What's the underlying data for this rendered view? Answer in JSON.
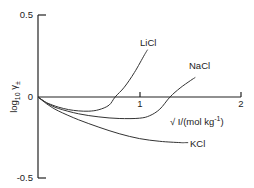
{
  "chart_data": {
    "type": "line",
    "title": "",
    "xlabel": "√ I/(mol kg⁻¹)",
    "xlabel_parts": {
      "sqrt": "√",
      "base": " I/(mol kg",
      "sup": "-1",
      "close": ")"
    },
    "ylabel": "log10 γ±",
    "ylabel_parts": {
      "log": "log",
      "sub": "10",
      "gamma": " γ",
      "pm": "±"
    },
    "xlim": [
      0,
      2
    ],
    "ylim": [
      -0.5,
      0.5
    ],
    "x_ticks": [
      {
        "value": 1,
        "label": "1"
      },
      {
        "value": 2,
        "label": "2"
      }
    ],
    "y_ticks": [
      {
        "value": 0.5,
        "label": "0.5"
      },
      {
        "value": 0,
        "label": "0"
      },
      {
        "value": -0.5,
        "label": "-0.5"
      }
    ],
    "grid": false,
    "series": [
      {
        "name": "LiCl",
        "x": [
          0,
          0.05,
          0.1,
          0.2,
          0.3,
          0.4,
          0.5,
          0.6,
          0.7,
          0.76,
          0.85,
          0.95,
          1.05,
          1.08
        ],
        "y": [
          0,
          -0.022,
          -0.039,
          -0.062,
          -0.077,
          -0.085,
          -0.087,
          -0.078,
          -0.05,
          0,
          0.06,
          0.15,
          0.26,
          0.29
        ]
      },
      {
        "name": "NaCl",
        "x": [
          0,
          0.05,
          0.1,
          0.2,
          0.4,
          0.6,
          0.8,
          1.0,
          1.1,
          1.2,
          1.3,
          1.4,
          1.5,
          1.55
        ],
        "y": [
          0,
          -0.022,
          -0.042,
          -0.07,
          -0.103,
          -0.122,
          -0.132,
          -0.13,
          -0.115,
          -0.075,
          0,
          0.055,
          0.1,
          0.12
        ]
      },
      {
        "name": "KCl",
        "x": [
          0,
          0.05,
          0.1,
          0.2,
          0.4,
          0.6,
          0.8,
          1.0,
          1.2,
          1.4,
          1.45
        ],
        "y": [
          0,
          -0.025,
          -0.048,
          -0.085,
          -0.14,
          -0.185,
          -0.225,
          -0.255,
          -0.272,
          -0.28,
          -0.28
        ]
      }
    ],
    "annotations": [
      {
        "series": "LiCl",
        "text": "LiCl"
      },
      {
        "series": "NaCl",
        "text": "NaCl"
      },
      {
        "series": "KCl",
        "text": "KCl"
      }
    ]
  }
}
